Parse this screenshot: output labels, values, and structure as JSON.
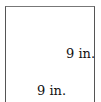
{
  "diagram": {
    "shape": "square",
    "side_label": "9 in.",
    "bottom_label": "9 in.",
    "stroke_color": "#555555"
  }
}
